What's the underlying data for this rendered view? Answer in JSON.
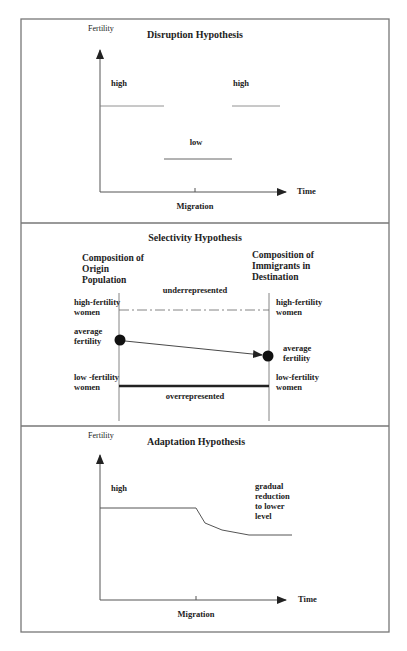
{
  "panels": [
    {
      "id": "disruption",
      "title": "Disruption Hypothesis",
      "y_axis_label": "Fertility",
      "x_axis_label": "Time",
      "tick_label": "Migration",
      "labels": {
        "high_left": "high",
        "high_right": "high",
        "low": "low"
      }
    },
    {
      "id": "selectivity",
      "title": "Selectivity Hypothesis",
      "left_header": [
        "Composition of",
        "Origin",
        "Population"
      ],
      "right_header": [
        "Composition of",
        "Immigrants in",
        "Destination"
      ],
      "top_band_label": "underrepresented",
      "bottom_band_label": "overrepresented",
      "left_rows": {
        "high": [
          "high-fertility",
          "women"
        ],
        "avg": [
          "average",
          "fertility"
        ],
        "low": [
          "low -fertility",
          "women"
        ]
      },
      "right_rows": {
        "high": [
          "high-fertility",
          "women"
        ],
        "avg": [
          "average",
          "fertility"
        ],
        "low": [
          "low-fertility",
          "women"
        ]
      }
    },
    {
      "id": "adaptation",
      "title": "Adaptation Hypothesis",
      "y_axis_label": "Fertility",
      "x_axis_label": "Time",
      "tick_label": "Migration",
      "labels": {
        "high": "high",
        "note": [
          "gradual",
          "reduction",
          "to lower",
          "level"
        ]
      }
    }
  ],
  "colors": {
    "line": "#555555",
    "ink": "#222222",
    "frame": "#777777"
  }
}
